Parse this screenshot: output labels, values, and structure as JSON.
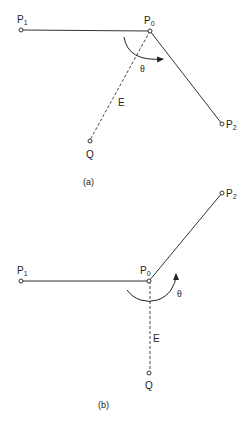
{
  "figure_a": {
    "caption": "(a)",
    "labels": {
      "p1": "P",
      "p1_sub": "1",
      "p0": "P",
      "p0_sub": "0",
      "p2": "P",
      "p2_sub": "2",
      "q": "Q",
      "e": "E",
      "theta": "θ"
    }
  },
  "figure_b": {
    "caption": "(b)",
    "labels": {
      "p1": "P",
      "p1_sub": "1",
      "p0": "P",
      "p0_sub": "0",
      "p2": "P",
      "p2_sub": "2",
      "q": "Q",
      "e": "E",
      "theta": "θ"
    }
  },
  "colors": {
    "stroke": "#333333",
    "text": "#222222"
  }
}
